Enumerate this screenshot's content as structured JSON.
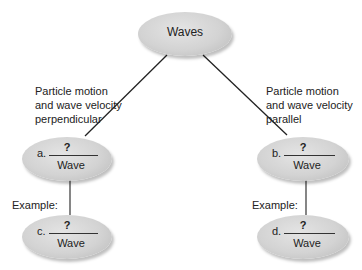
{
  "root": {
    "label": "Waves"
  },
  "branches": [
    {
      "description_lines": [
        "Particle motion",
        "and wave velocity",
        "perpendicular"
      ],
      "node": {
        "letter": "a.",
        "blank": "?",
        "suffix": "Wave"
      },
      "example_label": "Example:",
      "example_node": {
        "letter": "c.",
        "blank": "?",
        "suffix": "Wave"
      }
    },
    {
      "description_lines": [
        "Particle motion",
        "and wave velocity",
        "parallel"
      ],
      "node": {
        "letter": "b.",
        "blank": "?",
        "suffix": "Wave"
      },
      "example_label": "Example:",
      "example_node": {
        "letter": "d.",
        "blank": "?",
        "suffix": "Wave"
      }
    }
  ],
  "colors": {
    "node_fill": "#d3d3d3",
    "line": "#222222",
    "text": "#222222"
  }
}
